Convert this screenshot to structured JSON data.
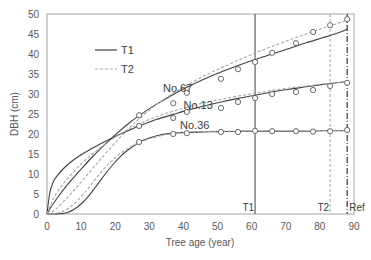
{
  "chart_data": {
    "type": "line",
    "title": "",
    "xlabel": "Tree age (year)",
    "ylabel": "DBH (cm)",
    "xlim": [
      0,
      90
    ],
    "ylim": [
      0,
      50
    ],
    "xticks": [
      0,
      10,
      20,
      30,
      40,
      50,
      60,
      70,
      80,
      90
    ],
    "yticks": [
      0,
      5,
      10,
      15,
      20,
      25,
      30,
      35,
      40,
      45,
      50
    ],
    "grid": false,
    "legend": {
      "position": "upper-left",
      "entries": [
        {
          "label": "T1",
          "style": "solid",
          "color": "#404040"
        },
        {
          "label": "T2",
          "style": "dashed",
          "color": "#a6a6a6"
        }
      ]
    },
    "vertical_lines": [
      {
        "label": "T1",
        "x": 61,
        "style": "solid",
        "color": "#404040"
      },
      {
        "label": "T2",
        "x": 83,
        "style": "dashed",
        "color": "#a6a6a6"
      },
      {
        "label": "Ref",
        "x": 88,
        "style": "dashdot",
        "color": "#404040"
      }
    ],
    "observed": [
      {
        "name": "No.67",
        "label_pos": [
          34,
          30.5
        ],
        "x": [
          27,
          37,
          41,
          51,
          56,
          61,
          66,
          73,
          78,
          83,
          88
        ],
        "y": [
          24.7,
          27.7,
          30.3,
          33.8,
          36.2,
          38.0,
          40.3,
          42.7,
          45.5,
          47.2,
          48.7
        ]
      },
      {
        "name": "No.13",
        "label_pos": [
          40,
          26.2
        ],
        "x": [
          27,
          37,
          41,
          51,
          56,
          61,
          66,
          73,
          78,
          83,
          88
        ],
        "y": [
          22.0,
          24.0,
          25.5,
          26.5,
          28.0,
          29.0,
          30.0,
          30.5,
          31.0,
          32.0,
          32.8
        ]
      },
      {
        "name": "No.36",
        "label_pos": [
          39,
          21.2
        ],
        "x": [
          27,
          37,
          41,
          51,
          56,
          61,
          66,
          73,
          78,
          83,
          88
        ],
        "y": [
          18.0,
          20.0,
          20.2,
          20.5,
          20.5,
          20.8,
          20.7,
          20.7,
          20.6,
          20.7,
          21.0
        ]
      }
    ],
    "series": [
      {
        "name": "No.67 T1",
        "style": "solid",
        "x": [
          0,
          1,
          3,
          5,
          8,
          10,
          13,
          16,
          20,
          24,
          27,
          32,
          37,
          41,
          46,
          51,
          56,
          61,
          66,
          71,
          76,
          81,
          85,
          88
        ],
        "y": [
          0,
          1.5,
          4.0,
          6.3,
          9.3,
          11.2,
          14.0,
          16.6,
          19.8,
          22.7,
          24.6,
          27.4,
          29.9,
          31.7,
          33.7,
          35.5,
          37.1,
          38.6,
          40.0,
          41.4,
          42.8,
          44.1,
          45.2,
          46.2
        ]
      },
      {
        "name": "No.67 T2",
        "style": "dashed",
        "x": [
          0,
          2,
          4,
          7,
          10,
          13,
          16,
          20,
          24,
          27,
          32,
          37,
          41,
          46,
          51,
          56,
          61,
          66,
          71,
          76,
          81,
          85,
          88
        ],
        "y": [
          0,
          0.8,
          2.4,
          5.0,
          8.0,
          11.0,
          14.0,
          17.8,
          21.4,
          23.8,
          27.3,
          30.2,
          32.2,
          34.5,
          36.5,
          38.4,
          40.2,
          41.9,
          43.5,
          45.0,
          46.5,
          47.6,
          48.5
        ]
      },
      {
        "name": "No.13 T1",
        "style": "solid",
        "x": [
          0,
          0.5,
          1,
          2,
          3,
          5,
          7,
          10,
          13,
          16,
          20,
          24,
          27,
          32,
          37,
          41,
          46,
          51,
          56,
          61,
          66,
          71,
          76,
          81,
          85,
          88
        ],
        "y": [
          0,
          3.5,
          6.0,
          8.3,
          9.6,
          11.5,
          13.0,
          14.8,
          16.3,
          17.7,
          19.4,
          20.9,
          22.0,
          23.6,
          24.9,
          25.9,
          27.0,
          28.0,
          28.9,
          29.7,
          30.5,
          31.2,
          31.8,
          32.4,
          32.8,
          33.1
        ]
      },
      {
        "name": "No.13 T2",
        "style": "dashed",
        "x": [
          0,
          1,
          2,
          3,
          5,
          7,
          10,
          13,
          16,
          20,
          24,
          27,
          32,
          37,
          41,
          46,
          51,
          56,
          61,
          66,
          71,
          76,
          81,
          85,
          88
        ],
        "y": [
          0,
          2.2,
          4.0,
          5.5,
          7.8,
          9.8,
          12.5,
          14.8,
          16.8,
          19.2,
          21.2,
          22.5,
          24.3,
          25.7,
          26.7,
          27.8,
          28.7,
          29.5,
          30.2,
          30.9,
          31.5,
          32.0,
          32.5,
          32.8,
          33.0
        ]
      },
      {
        "name": "No.36 T1",
        "style": "solid",
        "x": [
          0,
          4,
          6,
          8,
          10,
          12,
          14,
          16,
          18,
          20,
          22,
          24,
          27,
          30,
          34,
          37,
          41,
          46,
          51,
          56,
          61,
          66,
          71,
          76,
          81,
          85,
          88
        ],
        "y": [
          0,
          0.1,
          0.4,
          1.2,
          2.5,
          4.3,
          6.5,
          8.8,
          11.0,
          13.0,
          14.8,
          16.2,
          17.9,
          19.0,
          19.9,
          20.2,
          20.4,
          20.5,
          20.6,
          20.7,
          20.7,
          20.7,
          20.7,
          20.7,
          20.8,
          20.8,
          20.8
        ]
      },
      {
        "name": "No.36 T2",
        "style": "dashed",
        "x": [
          0,
          3,
          5,
          7,
          9,
          11,
          13,
          15,
          17,
          19,
          21,
          23,
          25,
          27,
          30,
          34,
          37,
          41,
          46,
          51,
          56,
          61,
          66,
          71,
          76,
          81,
          85,
          88
        ],
        "y": [
          0,
          0.2,
          0.8,
          1.9,
          3.4,
          5.3,
          7.4,
          9.6,
          11.6,
          13.3,
          14.8,
          16.0,
          17.0,
          17.8,
          18.8,
          19.7,
          20.1,
          20.4,
          20.6,
          20.7,
          20.7,
          20.8,
          20.8,
          20.8,
          20.8,
          20.9,
          20.9,
          20.9
        ]
      }
    ]
  },
  "plot": {
    "left": 47,
    "right": 354,
    "top": 14,
    "bottom": 214,
    "axis_color": "#a6a6a6",
    "solid_color": "#404040",
    "dashed_color": "#a6a6a6",
    "marker_color": "#595959"
  }
}
